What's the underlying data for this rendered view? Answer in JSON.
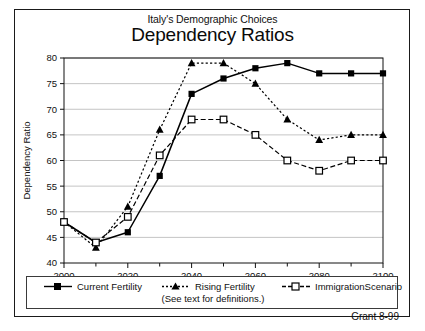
{
  "figure": {
    "title": "Italy's Demographic Choices",
    "subtitle": "Dependency Ratios",
    "credit": "Grant 8-99"
  },
  "legend": {
    "note": "(See text for definitions.)",
    "entries": [
      {
        "label": "Current Fertility",
        "marker": "filled-square",
        "line": "solid"
      },
      {
        "label": "Rising Fertility",
        "marker": "filled-triangle",
        "line": "dotted"
      },
      {
        "label": "ImmigrationScenario",
        "marker": "open-square",
        "line": "dashed"
      }
    ]
  },
  "axes": {
    "y_label": "Dependency Ratio",
    "y_ticks": [
      "40",
      "45",
      "50",
      "55",
      "60",
      "65",
      "70",
      "75",
      "80"
    ],
    "x_ticks": [
      "2000",
      "2020",
      "2040",
      "2060",
      "2080",
      "2100"
    ]
  },
  "chart_data": {
    "type": "line",
    "title": "Dependency Ratios",
    "subtitle": "Italy's Demographic Choices",
    "xlabel": "",
    "ylabel": "Dependency Ratio",
    "xlim": [
      2000,
      2100
    ],
    "ylim": [
      40,
      80
    ],
    "x": [
      2000,
      2010,
      2020,
      2030,
      2040,
      2050,
      2060,
      2070,
      2080,
      2090,
      2100
    ],
    "grid": "horizontal",
    "legend_position": "bottom",
    "annotation": "(See text for definitions.)",
    "series": [
      {
        "name": "Current Fertility",
        "marker": "filled-square",
        "linestyle": "solid",
        "color": "#000000",
        "values": [
          48,
          44,
          46,
          57,
          73,
          76,
          78,
          79,
          77,
          77,
          77
        ]
      },
      {
        "name": "Rising Fertility",
        "marker": "filled-triangle",
        "linestyle": "dotted",
        "color": "#000000",
        "values": [
          48,
          43,
          51,
          66,
          79,
          79,
          75,
          68,
          64,
          65,
          65
        ]
      },
      {
        "name": "ImmigrationScenario",
        "marker": "open-square",
        "linestyle": "dashed",
        "color": "#000000",
        "values": [
          48,
          44,
          49,
          61,
          68,
          68,
          65,
          60,
          58,
          60,
          60
        ]
      }
    ]
  }
}
